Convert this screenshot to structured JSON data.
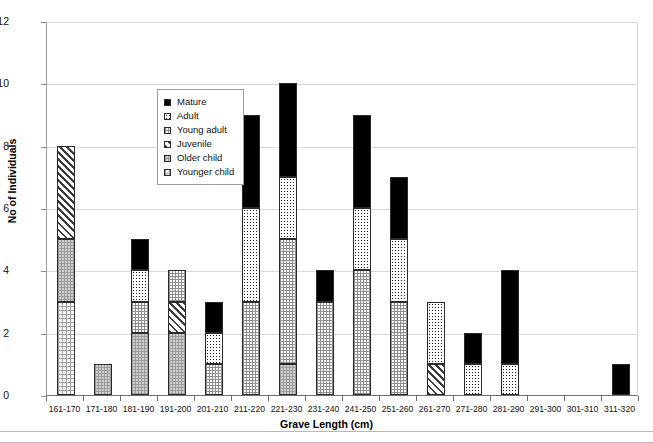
{
  "chart_data": {
    "type": "bar",
    "subtype": "stacked-bar",
    "title": "",
    "xlabel": "Grave Length (cm)",
    "ylabel": "No of Individuals",
    "ylim": [
      0,
      12
    ],
    "yticks": [
      0,
      2,
      4,
      6,
      8,
      10,
      12
    ],
    "grid": "horizontal",
    "legend_position": "inside-upper-left",
    "categories": [
      "161-170",
      "171-180",
      "181-190",
      "191-200",
      "201-210",
      "211-220",
      "221-230",
      "231-240",
      "241-250",
      "251-260",
      "261-270",
      "271-280",
      "281-290",
      "291-300",
      "301-310",
      "311-320"
    ],
    "series": [
      {
        "name": "Mature",
        "pattern": "solid-black",
        "values": [
          0,
          0,
          1,
          0,
          1,
          3,
          3,
          1,
          3,
          2,
          0,
          1,
          3,
          0,
          0,
          1
        ]
      },
      {
        "name": "Adult",
        "pattern": "dark-checker",
        "values": [
          0,
          0,
          1,
          0,
          1,
          3,
          2,
          0,
          2,
          2,
          2,
          1,
          1,
          0,
          0,
          0
        ]
      },
      {
        "name": "Young adult",
        "pattern": "light-checker",
        "values": [
          0,
          0,
          1,
          1,
          1,
          3,
          4,
          3,
          4,
          3,
          0,
          0,
          0,
          0,
          0,
          0
        ]
      },
      {
        "name": "Juvenile",
        "pattern": "diagonal-hatch",
        "values": [
          3,
          0,
          0,
          1,
          0,
          0,
          0,
          0,
          0,
          0,
          1,
          0,
          0,
          0,
          0,
          0
        ]
      },
      {
        "name": "Older child",
        "pattern": "gray-checker",
        "values": [
          2,
          1,
          2,
          2,
          0,
          0,
          1,
          0,
          0,
          0,
          0,
          0,
          0,
          0,
          0,
          0
        ]
      },
      {
        "name": "Younger child",
        "pattern": "light-dotted",
        "values": [
          3,
          0,
          0,
          0,
          0,
          0,
          0,
          0,
          0,
          0,
          0,
          0,
          0,
          0,
          0,
          0
        ]
      }
    ],
    "totals": [
      8,
      1,
      5,
      4,
      3,
      9,
      10,
      4,
      9,
      7,
      3,
      2,
      4,
      0,
      0,
      1
    ],
    "stack_order_bottom_to_top": [
      "Younger child",
      "Older child",
      "Juvenile",
      "Young adult",
      "Adult",
      "Mature"
    ]
  },
  "legend": {
    "items": [
      {
        "label": "Mature",
        "swatch": "legend-swatch-mature"
      },
      {
        "label": "Adult",
        "swatch": "legend-swatch-adult"
      },
      {
        "label": "Young adult",
        "swatch": "legend-swatch-young-adult"
      },
      {
        "label": "Juvenile",
        "swatch": "legend-swatch-juvenile"
      },
      {
        "label": "Older child",
        "swatch": "legend-swatch-older-child"
      },
      {
        "label": "Younger child",
        "swatch": "legend-swatch-younger-child"
      }
    ]
  },
  "colors": {
    "mature": "#000000",
    "adult": "#1d1d1d",
    "young_adult": "#fbfbfb",
    "juvenile": "#f2f2f2",
    "older_child": "#cfcfcf",
    "younger_child": "#f6f6f6",
    "grid": "#d9d9d9",
    "axis": "#6f6f6f",
    "background": "#ffffff"
  }
}
